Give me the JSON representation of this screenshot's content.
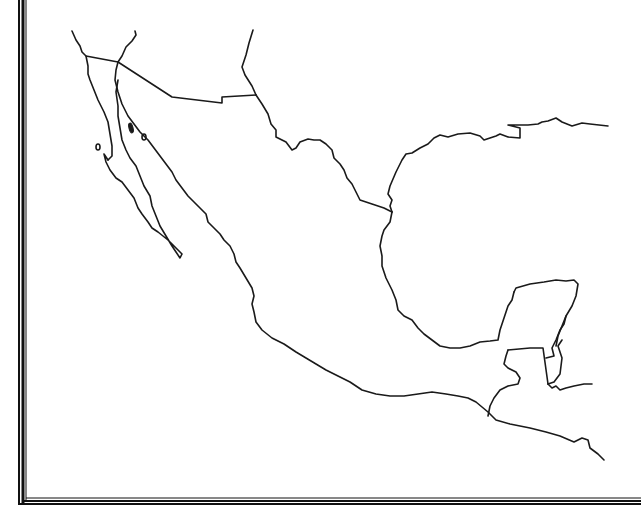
{
  "map": {
    "type": "blank outline map",
    "region": "Mexico and Central America",
    "labels": [],
    "colors": {
      "background": "#ffffff",
      "outline": "#1a1a1a",
      "frame": "#111111"
    },
    "features": [
      "us-mexico-border",
      "baja-california-peninsula",
      "gulf-of-california",
      "pacific-coastline",
      "gulf-of-mexico-coastline",
      "yucatan-peninsula",
      "belize-border",
      "guatemala-border",
      "islands"
    ]
  }
}
